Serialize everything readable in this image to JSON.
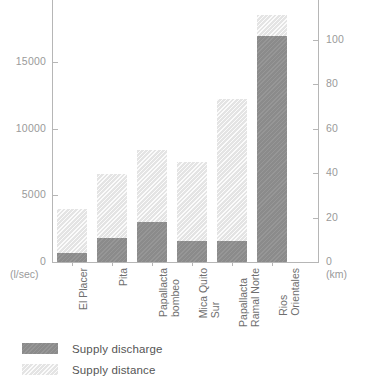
{
  "chart_data": {
    "type": "bar",
    "stacked": true,
    "title": "",
    "xlabel": "",
    "ylabel": "",
    "grid": false,
    "legend_position": "bottom-left",
    "categories": [
      "El Placer",
      "Pita",
      "Papallacta bombeo",
      "Mica Quito Sur",
      "Papallacta Ramal Norte",
      "Rios Orientales"
    ],
    "category_lines": [
      [
        "El Placer",
        ""
      ],
      [
        "Pita",
        ""
      ],
      [
        "Papallacta",
        "bombeo"
      ],
      [
        "Mica Quito",
        "Sur"
      ],
      [
        "Papallacta",
        "Ramal Norte"
      ],
      [
        "Rios",
        "Orientales"
      ]
    ],
    "series": [
      {
        "name": "Supply discharge",
        "unit": "(l/sec)",
        "axis": "left",
        "color": "#8b8b8b",
        "values": [
          675,
          1800,
          3000,
          1575,
          1575,
          16950
        ]
      },
      {
        "name": "Supply distance",
        "unit": "(km)",
        "axis": "right",
        "color": "#e4e4e4",
        "values": [
          3975,
          6600,
          8400,
          7500,
          12225,
          18525
        ]
      }
    ],
    "left_axis": {
      "unit": "(l/sec)",
      "ticks": [
        0,
        5000,
        10000,
        15000,
        20000
      ],
      "tick_labels": [
        "0",
        "5000",
        "10000",
        "15000",
        "20000"
      ],
      "ylim": [
        0,
        20000
      ]
    },
    "right_axis": {
      "unit": "(km)",
      "ticks": [
        0,
        20,
        40,
        60,
        80,
        100,
        120
      ],
      "tick_labels": [
        "0",
        "20",
        "40",
        "60",
        "80",
        "100",
        "120"
      ],
      "ylim": [
        0,
        120
      ]
    }
  },
  "legend": {
    "items": [
      {
        "label": "Supply discharge",
        "color": "#8b8b8b"
      },
      {
        "label": "Supply distance",
        "color": "#e4e4e4"
      }
    ]
  }
}
